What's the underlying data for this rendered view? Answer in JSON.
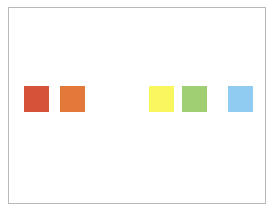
{
  "header": {
    "clipped_text": ""
  },
  "swatches": [
    {
      "name": "red",
      "color": "#d6533a",
      "x": 24
    },
    {
      "name": "orange",
      "color": "#e2793a",
      "x": 60
    },
    {
      "name": "yellow",
      "color": "#f8f85e",
      "x": 149
    },
    {
      "name": "green",
      "color": "#a0ce73",
      "x": 182
    },
    {
      "name": "blue",
      "color": "#90cbf1",
      "x": 228
    }
  ]
}
